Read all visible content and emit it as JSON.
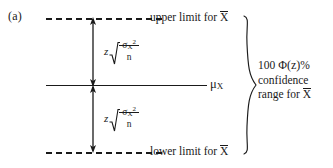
{
  "figure": {
    "panel_label": "(a)",
    "upper_limit_caption": {
      "prefix": "upper limit for ",
      "variable": "X"
    },
    "lower_limit_caption": {
      "prefix": "lower limit for ",
      "variable": "X"
    },
    "mean_label": {
      "symbol": "μ",
      "subscript": "X"
    },
    "margin_of_error": {
      "coefficient": "z",
      "radicand_numerator_base": "σ",
      "radicand_numerator_subscript": "X",
      "radicand_numerator_superscript": "2",
      "radicand_denominator": "n"
    },
    "range_caption": {
      "line1_prefix": "100 ",
      "line1_phi": "Φ(z)",
      "line1_suffix": "%",
      "line2": "confidence",
      "line3_prefix": "range for ",
      "line3_variable": "X"
    },
    "colors": {
      "ink": "#1a1a1a",
      "background": "#ffffff"
    }
  }
}
